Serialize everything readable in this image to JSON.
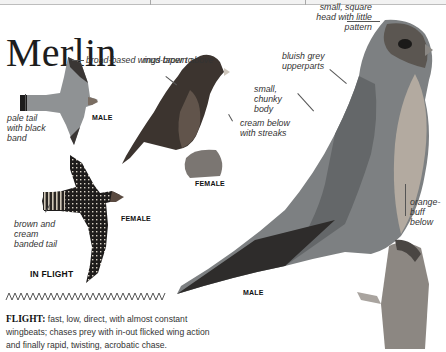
{
  "page": {
    "title": "Merlin"
  },
  "labels": {
    "male_flight_wings": "broad-based wings taper to point",
    "male_flight_tail": "pale tail with black band",
    "female_flight_tail": "brown and cream banded tail",
    "female_above": "mud-brown above",
    "female_below": "cream below with streaks",
    "male_head": "small, square head with little pattern",
    "male_upperparts": "bluish grey upperparts",
    "male_body": "small, chunky body",
    "male_below": "orange-buff below"
  },
  "captions": {
    "flight_male": "MALE",
    "flight_female": "FEMALE",
    "in_flight": "IN FLIGHT",
    "perched_female": "FEMALE",
    "perched_male": "MALE"
  },
  "flight_description": {
    "heading": "FLIGHT:",
    "text": "fast, low, direct, with almost constant wingbeats; chases prey with in-out flicked wing action and finally rapid, twisting, acrobatic chase."
  },
  "icons": {
    "flight_pattern": "zigzag-flight-path-icon"
  },
  "colors": {
    "text": "#222222",
    "bird_grey": "#8a8d8f",
    "bird_dark": "#2b2622",
    "bird_brown": "#4a3f37"
  }
}
